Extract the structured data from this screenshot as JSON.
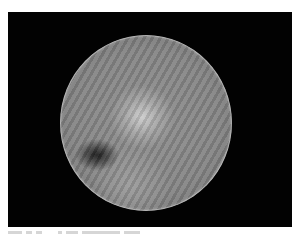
{
  "image": {
    "subject": "grayscale telescopic image of a planetary disk",
    "panel_background": "#020202",
    "page_background": "#ffffff",
    "disk": {
      "center_px": [
        146,
        123
      ],
      "radius_px": 87,
      "base_tone": "#8e8e8e",
      "features": [
        {
          "name": "bright-region",
          "center_px": [
            135,
            115
          ],
          "tone": "#d7d7d7"
        },
        {
          "name": "dark-spot",
          "center_px": [
            95,
            155
          ],
          "tone": "#0a0a0a"
        }
      ],
      "artifact": "diagonal interference stripes"
    }
  },
  "caption": {
    "legible": false
  }
}
